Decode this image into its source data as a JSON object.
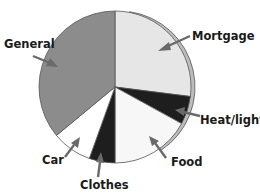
{
  "chart_data": {
    "type": "pie",
    "title": "",
    "categories": [
      "Mortgage",
      "Heat/light",
      "Food",
      "Clothes",
      "Car",
      "General"
    ],
    "values": [
      27,
      6,
      17,
      5.5,
      8.5,
      36
    ],
    "unit": "percent (estimated from slice angles)",
    "colors": [
      "#e6e6e6",
      "#1e1e1e",
      "#f7f7f7",
      "#1e1e1e",
      "#ffffff",
      "#8c8c8c"
    ],
    "start_angle_deg": 0,
    "direction": "clockwise",
    "legend": "none (labels with arrows)",
    "rim_color": "#bdbdbd",
    "outline_color": "#555555"
  },
  "labels": {
    "mortgage": "Mortgage",
    "heat_light": "Heat/light",
    "food": "Food",
    "clothes": "Clothes",
    "car": "Car",
    "general": "General"
  }
}
